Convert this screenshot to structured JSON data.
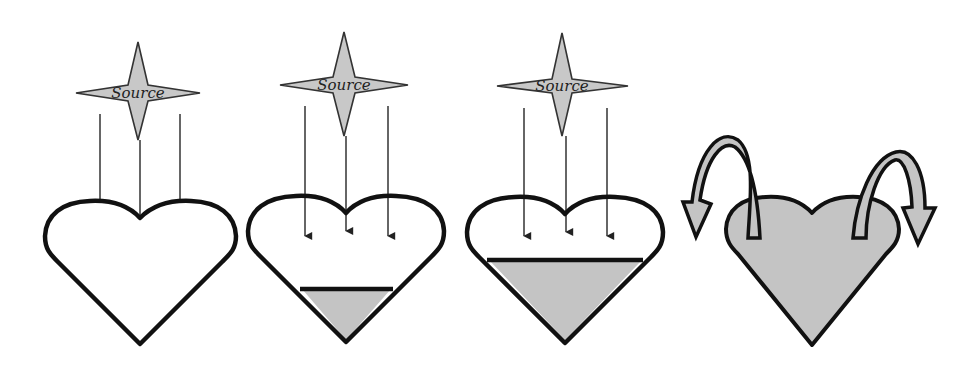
{
  "diagram": {
    "panels": [
      {
        "id": "empty",
        "source_label": "Source",
        "fill_level": "empty",
        "rays": 3
      },
      {
        "id": "partially-filled",
        "source_label": "Source",
        "fill_level": "low",
        "rays": 3
      },
      {
        "id": "more-filled",
        "source_label": "Source",
        "fill_level": "medium",
        "rays": 3
      },
      {
        "id": "overflowing",
        "fill_level": "full",
        "overflow_arrows": 2
      }
    ],
    "colors": {
      "fill": "#c4c4c4",
      "outline": "#111111",
      "star_fill": "#c8c8c8",
      "background": "#ffffff"
    }
  }
}
